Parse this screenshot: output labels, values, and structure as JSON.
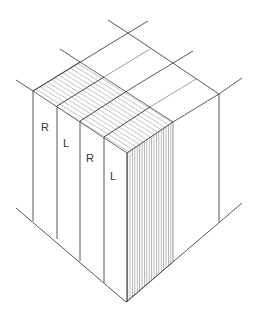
{
  "diagram": {
    "labels": [
      {
        "text": "R",
        "x": 45,
        "y": 131
      },
      {
        "text": "L",
        "x": 67,
        "y": 147
      },
      {
        "text": "R",
        "x": 90,
        "y": 162
      },
      {
        "text": "L",
        "x": 114,
        "y": 180
      }
    ],
    "colors": {
      "line": "#444444",
      "hatch": "#666666",
      "background": "#ffffff"
    }
  }
}
